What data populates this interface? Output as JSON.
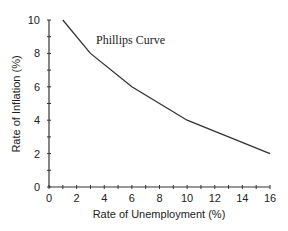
{
  "chart_data": {
    "type": "line",
    "title": "Phillips Curve",
    "xlabel": "Rate of Unemployment (%)",
    "ylabel": "Rate of Inflation (%)",
    "xlim": [
      0,
      16
    ],
    "ylim": [
      0,
      10
    ],
    "x_ticks": [
      0,
      2,
      4,
      6,
      8,
      10,
      12,
      14,
      16
    ],
    "y_ticks": [
      0,
      2,
      4,
      6,
      8,
      10
    ],
    "grid": false,
    "legend": null,
    "series": [
      {
        "name": "Phillips Curve",
        "x": [
          1,
          3,
          6,
          10,
          16
        ],
        "y": [
          10,
          8,
          6,
          4,
          2
        ]
      }
    ],
    "colors": {
      "line": "#333333",
      "axis": "#333333"
    }
  }
}
